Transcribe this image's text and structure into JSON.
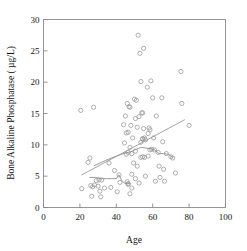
{
  "chart_data": {
    "type": "scatter",
    "title": "",
    "xlabel": "Age",
    "ylabel": "Bone Alkaline Phosphatase ( µg/L)",
    "xlim": [
      0,
      100
    ],
    "ylim": [
      0,
      30
    ],
    "xticks": [
      0,
      20,
      40,
      60,
      80,
      100
    ],
    "yticks": [
      0,
      5,
      10,
      15,
      20,
      25,
      30
    ],
    "xtick_labels": [
      "0",
      "20",
      "40",
      "60",
      "80",
      "100"
    ],
    "ytick_labels": [
      "0",
      "5",
      "10",
      "15",
      "20",
      "25",
      "30"
    ],
    "grid": false,
    "legend": null,
    "marker": "open-circle",
    "marker_color": "#9a9a9a",
    "line_color": "#9a9a9a",
    "points": [
      [
        20.5,
        15.5
      ],
      [
        21.0,
        3.0
      ],
      [
        24.5,
        7.2
      ],
      [
        25.5,
        7.9
      ],
      [
        26.0,
        3.5
      ],
      [
        26.5,
        1.8
      ],
      [
        27.5,
        16.0
      ],
      [
        27.0,
        3.3
      ],
      [
        28.0,
        3.6
      ],
      [
        29.0,
        4.3
      ],
      [
        30.0,
        3.4
      ],
      [
        30.5,
        4.4
      ],
      [
        31.0,
        2.6
      ],
      [
        31.5,
        1.7
      ],
      [
        32.0,
        4.4
      ],
      [
        33.5,
        3.1
      ],
      [
        36.0,
        7.1
      ],
      [
        37.0,
        3.2
      ],
      [
        39.0,
        5.9
      ],
      [
        40.5,
        2.5
      ],
      [
        41.5,
        5.2
      ],
      [
        42.0,
        4.0
      ],
      [
        44.0,
        13.2
      ],
      [
        44.5,
        10.3
      ],
      [
        45.0,
        14.6
      ],
      [
        45.5,
        11.9
      ],
      [
        45.5,
        8.5
      ],
      [
        46.0,
        16.6
      ],
      [
        46.5,
        12.0
      ],
      [
        46.5,
        8.8
      ],
      [
        46.0,
        4.1
      ],
      [
        46.5,
        3.8
      ],
      [
        46.5,
        3.7
      ],
      [
        47.0,
        16.1
      ],
      [
        47.5,
        16.0
      ],
      [
        47.5,
        9.6
      ],
      [
        47.5,
        2.2
      ],
      [
        48.0,
        13.1
      ],
      [
        48.5,
        8.6
      ],
      [
        48.5,
        5.3
      ],
      [
        48.5,
        3.1
      ],
      [
        49.0,
        11.1
      ],
      [
        49.5,
        7.1
      ],
      [
        50.0,
        17.3
      ],
      [
        50.5,
        14.2
      ],
      [
        50.5,
        9.0
      ],
      [
        50.5,
        4.6
      ],
      [
        51.0,
        17.1
      ],
      [
        51.5,
        12.8
      ],
      [
        51.5,
        6.6
      ],
      [
        52.0,
        27.5
      ],
      [
        52.5,
        14.5
      ],
      [
        52.5,
        3.9
      ],
      [
        53.0,
        24.6
      ],
      [
        53.5,
        20.1
      ],
      [
        53.5,
        10.4
      ],
      [
        53.5,
        8.0
      ],
      [
        54.0,
        15.1
      ],
      [
        54.5,
        15.1
      ],
      [
        54.5,
        11.0
      ],
      [
        54.5,
        10.9
      ],
      [
        54.5,
        8.1
      ],
      [
        55.0,
        25.4
      ],
      [
        55.0,
        12.6
      ],
      [
        55.5,
        11.1
      ],
      [
        55.5,
        8.0
      ],
      [
        56.0,
        10.8
      ],
      [
        56.0,
        5.0
      ],
      [
        57.0,
        19.2
      ],
      [
        57.5,
        11.8
      ],
      [
        57.5,
        8.2
      ],
      [
        58.0,
        12.7
      ],
      [
        58.5,
        12.4
      ],
      [
        58.5,
        9.2
      ],
      [
        59.0,
        20.2
      ],
      [
        59.5,
        9.3
      ],
      [
        60.0,
        17.5
      ],
      [
        60.5,
        11.1
      ],
      [
        61.0,
        9.2
      ],
      [
        61.5,
        4.2
      ],
      [
        62.0,
        14.6
      ],
      [
        63.0,
        8.8
      ],
      [
        63.5,
        6.6
      ],
      [
        64.0,
        4.8
      ],
      [
        65.0,
        17.5
      ],
      [
        65.5,
        10.5
      ],
      [
        66.0,
        6.1
      ],
      [
        66.5,
        4.2
      ],
      [
        67.5,
        8.6
      ],
      [
        70.0,
        8.1
      ],
      [
        71.0,
        7.9
      ],
      [
        72.5,
        5.5
      ],
      [
        75.5,
        21.7
      ],
      [
        76.0,
        16.6
      ],
      [
        80.0,
        13.1
      ]
    ],
    "regression_line": {
      "label": "linear fit",
      "points": [
        [
          21.0,
          5.2
        ],
        [
          77.5,
          14.0
        ]
      ]
    },
    "smooth_curves": [
      {
        "label": "lowess upper",
        "points": [
          [
            28.0,
            6.7
          ],
          [
            34.0,
            7.5
          ],
          [
            40.0,
            8.2
          ],
          [
            45.0,
            8.7
          ],
          [
            48.0,
            8.9
          ],
          [
            51.0,
            9.3
          ],
          [
            53.5,
            9.6
          ],
          [
            56.0,
            9.5
          ],
          [
            58.5,
            9.4
          ],
          [
            61.0,
            9.2
          ],
          [
            63.5,
            8.6
          ],
          [
            66.0,
            8.6
          ],
          [
            68.5,
            8.5
          ],
          [
            71.0,
            8.0
          ]
        ]
      },
      {
        "label": "lowess lower",
        "points": [
          [
            25.5,
            4.8
          ],
          [
            28.5,
            4.8
          ],
          [
            31.5,
            4.6
          ],
          [
            34.5,
            4.6
          ],
          [
            37.5,
            4.6
          ],
          [
            40.0,
            4.6
          ],
          [
            41.5,
            5.2
          ],
          [
            43.0,
            4.3
          ],
          [
            44.5,
            3.9
          ],
          [
            46.0,
            3.8
          ],
          [
            47.5,
            3.8
          ]
        ]
      }
    ]
  }
}
